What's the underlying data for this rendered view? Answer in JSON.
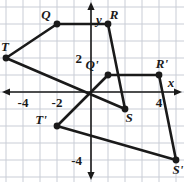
{
  "figure": {
    "kind": "coordinate-plane-transformation",
    "background": "#ffffff",
    "grid_color": "#c9cdd6",
    "axis_color": "#1a1a1a",
    "shape_color": "#1a1a1a",
    "pixels_per_unit": 17,
    "origin_px": {
      "x": 91,
      "y": 92
    }
  },
  "axes": {
    "x_label": "x",
    "y_label": "y",
    "x_ticks": [
      {
        "label": "-4",
        "value": -4
      },
      {
        "label": "-2",
        "value": -2
      },
      {
        "label": "4",
        "value": 4
      }
    ],
    "y_ticks": [
      {
        "label": "2",
        "value": 2
      },
      {
        "label": "-4",
        "value": -4
      }
    ],
    "x_range": [
      -5.5,
      5.5
    ],
    "y_range": [
      -5.4,
      5.3
    ]
  },
  "chart_data": {
    "type": "scatter",
    "title": "",
    "xlabel": "x",
    "ylabel": "y",
    "grid": true,
    "series": [
      {
        "name": "QRST",
        "closed": true,
        "points": [
          {
            "label": "Q",
            "x": -2,
            "y": 4,
            "label_dx": -11,
            "label_dy": -5
          },
          {
            "label": "R",
            "x": 1,
            "y": 4,
            "label_dx": 6,
            "label_dy": -5
          },
          {
            "label": "S",
            "x": 2,
            "y": -1,
            "label_dx": 4,
            "label_dy": 13
          },
          {
            "label": "T",
            "x": -5,
            "y": 2,
            "label_dx": -1,
            "label_dy": -7
          }
        ]
      },
      {
        "name": "Q'R'S'T'",
        "closed": true,
        "points": [
          {
            "label": "Q'",
            "x": 1,
            "y": 1,
            "label_dx": -16,
            "label_dy": -6
          },
          {
            "label": "R'",
            "x": 4,
            "y": 1,
            "label_dx": 3,
            "label_dy": -7
          },
          {
            "label": "S'",
            "x": 5,
            "y": -4,
            "label_dx": 2,
            "label_dy": 14
          },
          {
            "label": "T'",
            "x": -2,
            "y": -2,
            "label_dx": -16,
            "label_dy": -2
          }
        ]
      }
    ]
  }
}
